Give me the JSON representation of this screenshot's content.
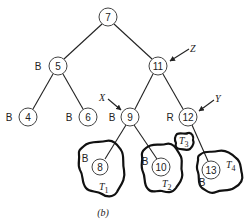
{
  "diagram": {
    "type": "red-black-tree",
    "caption": "(b)",
    "nodes": [
      {
        "key": "7",
        "color": "",
        "x": 108,
        "y": 17
      },
      {
        "key": "5",
        "color": "B",
        "x": 58,
        "y": 66
      },
      {
        "key": "11",
        "color": "",
        "x": 158,
        "y": 66
      },
      {
        "key": "4",
        "color": "B",
        "x": 28,
        "y": 117
      },
      {
        "key": "6",
        "color": "B",
        "x": 88,
        "y": 117
      },
      {
        "key": "9",
        "color": "B",
        "x": 130,
        "y": 117
      },
      {
        "key": "12",
        "color": "R",
        "x": 188,
        "y": 117
      },
      {
        "key": "8",
        "color": "B",
        "x": 100,
        "y": 167
      },
      {
        "key": "10",
        "color": "B",
        "x": 161,
        "y": 167
      },
      {
        "key": "13",
        "color": "B",
        "x": 211,
        "y": 170
      }
    ],
    "edges": [
      [
        "7",
        "5"
      ],
      [
        "7",
        "11"
      ],
      [
        "5",
        "4"
      ],
      [
        "5",
        "6"
      ],
      [
        "11",
        "9"
      ],
      [
        "11",
        "12"
      ],
      [
        "9",
        "8"
      ],
      [
        "9",
        "10"
      ],
      [
        "12",
        "13"
      ]
    ],
    "subtrees": [
      {
        "name": "T",
        "sub": "1",
        "root": "8"
      },
      {
        "name": "T",
        "sub": "2",
        "root": "10"
      },
      {
        "name": "T",
        "sub": "3",
        "root": ""
      },
      {
        "name": "T",
        "sub": "4",
        "root": "13"
      }
    ],
    "pointers": [
      {
        "label": "X",
        "target": "9"
      },
      {
        "label": "Y",
        "target": "12"
      },
      {
        "label": "Z",
        "target": "11"
      }
    ]
  }
}
